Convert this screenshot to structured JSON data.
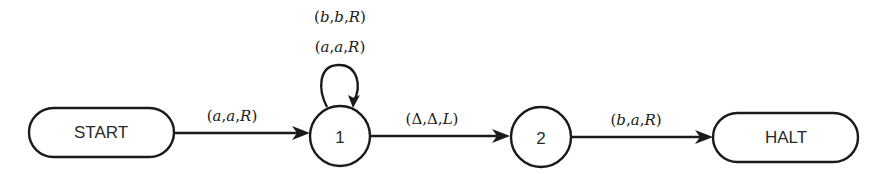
{
  "diagram": {
    "type": "turing-machine-state-diagram",
    "nodes": [
      {
        "id": "start",
        "label": "START",
        "shape": "rounded-rect"
      },
      {
        "id": "q1",
        "label": "1",
        "shape": "circle"
      },
      {
        "id": "q2",
        "label": "2",
        "shape": "circle"
      },
      {
        "id": "halt",
        "label": "HALT",
        "shape": "rounded-rect"
      }
    ],
    "edges": [
      {
        "from": "start",
        "to": "q1",
        "label": "(a,a,R)",
        "parts": [
          "(",
          "a",
          ",",
          "a",
          ",",
          "R",
          ")"
        ]
      },
      {
        "from": "q1",
        "to": "q1",
        "labels": [
          "(b,b,R)",
          "(a,a,R)"
        ],
        "parts_top": [
          "(",
          "b",
          ",",
          "b",
          ",",
          "R",
          ")"
        ],
        "parts_bottom": [
          "(",
          "a",
          ",",
          "a",
          ",",
          "R",
          ")"
        ]
      },
      {
        "from": "q1",
        "to": "q2",
        "label": "(Δ,Δ,L)",
        "parts": [
          "(",
          "Δ",
          ",",
          "Δ",
          ",",
          "L",
          ")"
        ]
      },
      {
        "from": "q2",
        "to": "halt",
        "label": "(b,a,R)",
        "parts": [
          "(",
          "b",
          ",",
          "a",
          ",",
          "R",
          ")"
        ]
      }
    ]
  },
  "colors": {
    "stroke": "#1a1a1a",
    "background": "#ffffff"
  }
}
